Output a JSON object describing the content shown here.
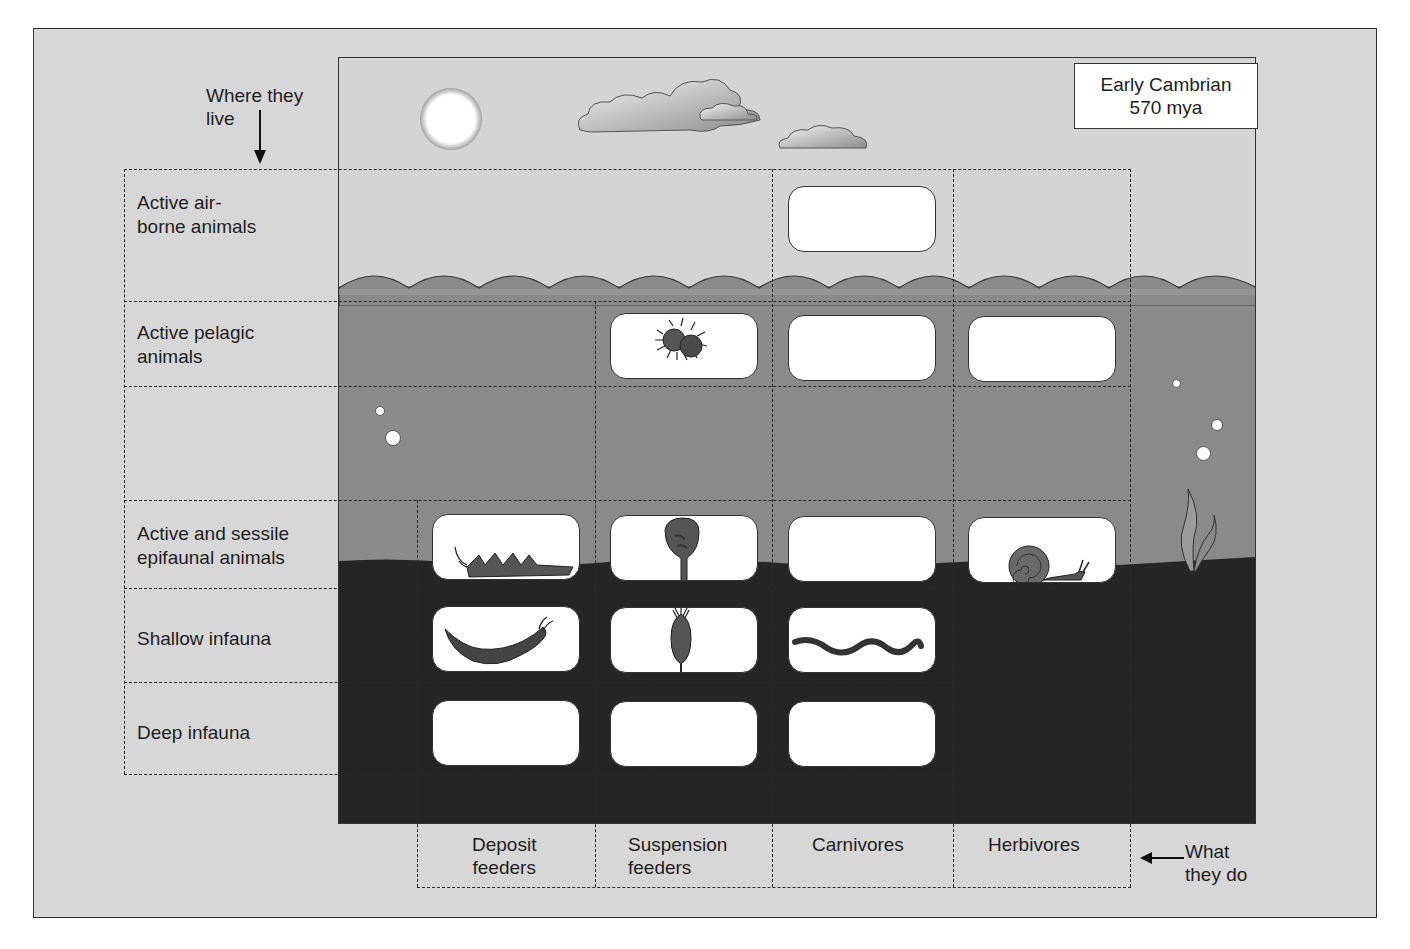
{
  "diagram": {
    "era_label_line1": "Early Cambrian",
    "era_label_line2": "570 mya",
    "y_axis_title_line1": "Where they",
    "y_axis_title_line2": "live",
    "x_axis_title_line1": "What",
    "x_axis_title_line2": "they do",
    "rows": [
      {
        "line1": "Active air-",
        "line2": "borne animals"
      },
      {
        "line1": "Active pelagic",
        "line2": "animals"
      },
      {
        "line1": "Active and sessile",
        "line2": "epifaunal animals"
      },
      {
        "line1": "Shallow infauna",
        "line2": ""
      },
      {
        "line1": "Deep infauna",
        "line2": ""
      }
    ],
    "columns": [
      {
        "line1": "Deposit",
        "line2": "feeders"
      },
      {
        "line1": "Suspension",
        "line2": "feeders"
      },
      {
        "line1": "Carnivores",
        "line2": ""
      },
      {
        "line1": "Herbivores",
        "line2": ""
      }
    ],
    "cells": [
      {
        "row": "Active air-borne animals",
        "column": "Carnivores",
        "content": "empty"
      },
      {
        "row": "Active pelagic animals",
        "column": "Suspension feeders",
        "content": "trilobite-like arthropod icon"
      },
      {
        "row": "Active pelagic animals",
        "column": "Carnivores",
        "content": "empty"
      },
      {
        "row": "Active pelagic animals",
        "column": "Herbivores",
        "content": "empty"
      },
      {
        "row": "Active and sessile epifaunal animals",
        "column": "Deposit feeders",
        "content": "arthropod icon"
      },
      {
        "row": "Active and sessile epifaunal animals",
        "column": "Suspension feeders",
        "content": "sponge icon"
      },
      {
        "row": "Active and sessile epifaunal animals",
        "column": "Carnivores",
        "content": "empty"
      },
      {
        "row": "Active and sessile epifaunal animals",
        "column": "Herbivores",
        "content": "snail icon"
      },
      {
        "row": "Shallow infauna",
        "column": "Deposit feeders",
        "content": "arthropod larva icon"
      },
      {
        "row": "Shallow infauna",
        "column": "Suspension feeders",
        "content": "sea pen icon"
      },
      {
        "row": "Shallow infauna",
        "column": "Carnivores",
        "content": "worm icon"
      },
      {
        "row": "Deep infauna",
        "column": "Deposit feeders",
        "content": "empty"
      },
      {
        "row": "Deep infauna",
        "column": "Suspension feeders",
        "content": "empty"
      },
      {
        "row": "Deep infauna",
        "column": "Carnivores",
        "content": "empty"
      }
    ],
    "colors": {
      "panel": "#d7d7d7",
      "sky": "#d4d4d4",
      "water": "#8a8a8a",
      "sediment": "#252525",
      "cell": "#ffffff",
      "line": "#2a2a2a"
    }
  }
}
